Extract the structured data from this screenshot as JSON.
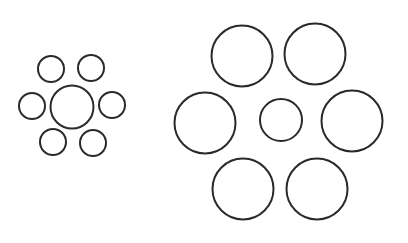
{
  "figure": {
    "type": "ebbinghaus-illusion",
    "width": 408,
    "height": 243,
    "background": "#ffffff",
    "stroke_color": "#2a2a2a",
    "stroke_width": 2
  },
  "groups": [
    {
      "name": "small-surround-group",
      "center_circle": {
        "cx": 72,
        "cy": 107,
        "r": 21.5
      },
      "surround_circles": [
        {
          "cx": 51,
          "cy": 69,
          "r": 13
        },
        {
          "cx": 91,
          "cy": 68,
          "r": 13
        },
        {
          "cx": 32,
          "cy": 106,
          "r": 13
        },
        {
          "cx": 112,
          "cy": 105,
          "r": 13
        },
        {
          "cx": 53,
          "cy": 142,
          "r": 13
        },
        {
          "cx": 93,
          "cy": 143,
          "r": 13
        }
      ]
    },
    {
      "name": "large-surround-group",
      "center_circle": {
        "cx": 281,
        "cy": 120,
        "r": 21
      },
      "surround_circles": [
        {
          "cx": 242,
          "cy": 56,
          "r": 30.5
        },
        {
          "cx": 315,
          "cy": 54,
          "r": 30.5
        },
        {
          "cx": 205,
          "cy": 123,
          "r": 30.5
        },
        {
          "cx": 352,
          "cy": 121,
          "r": 30.5
        },
        {
          "cx": 243,
          "cy": 189,
          "r": 30.5
        },
        {
          "cx": 317,
          "cy": 189,
          "r": 30.5
        }
      ]
    }
  ]
}
